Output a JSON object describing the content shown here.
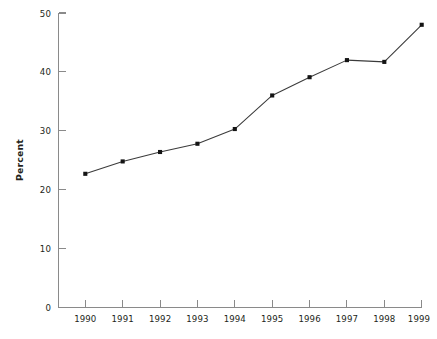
{
  "chart_data": {
    "type": "line",
    "title": "",
    "subtitle": "",
    "xlabel": "",
    "ylabel": "Percent",
    "categories": [
      "1990",
      "1991",
      "1992",
      "1993",
      "1994",
      "1995",
      "1996",
      "1997",
      "1998",
      "1999"
    ],
    "x": [
      1990,
      1991,
      1992,
      1993,
      1994,
      1995,
      1996,
      1997,
      1998,
      1999
    ],
    "values": [
      22.7,
      24.8,
      26.4,
      27.8,
      30.3,
      36.0,
      39.1,
      42.0,
      41.7,
      48.0
    ],
    "series": [
      {
        "name": "Percent",
        "values": [
          22.7,
          24.8,
          26.4,
          27.8,
          30.3,
          36.0,
          39.1,
          42.0,
          41.7,
          48.0
        ],
        "marker": "square",
        "color": "#141414"
      }
    ],
    "ylim": [
      0,
      50
    ],
    "yticks": [
      0,
      10,
      20,
      30,
      40,
      50
    ],
    "ytick_labels": [
      "0",
      "10",
      "20",
      "30",
      "40",
      "50"
    ],
    "xticks": [
      1990,
      1991,
      1992,
      1993,
      1994,
      1995,
      1996,
      1997,
      1998,
      1999
    ],
    "xtick_labels": [
      "1990",
      "1991",
      "1992",
      "1993",
      "1994",
      "1995",
      "1996",
      "1997",
      "1998",
      "1999"
    ],
    "xlim": [
      1989.6,
      1999.3
    ],
    "grid": false,
    "legend": false,
    "legend_position": "none",
    "annotations": [],
    "axis_color": "#8a8a8a",
    "line_color": "#3b3b3b",
    "background_color": "#ffffff"
  },
  "axes": {
    "ylabel": "Percent",
    "ytick_labels": [
      "50",
      "40",
      "30",
      "20",
      "10",
      "0"
    ],
    "xtick_labels": [
      "1990",
      "1991",
      "1992",
      "1993",
      "1994",
      "1995",
      "1996",
      "1997",
      "1998",
      "1999"
    ]
  }
}
